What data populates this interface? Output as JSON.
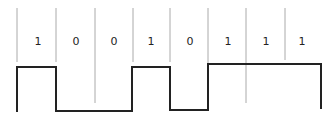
{
  "diagram": {
    "title": "",
    "bits": [
      "1",
      "0",
      "0",
      "1",
      "0",
      "1",
      "1",
      "1"
    ],
    "gridlines_x": [
      17,
      56,
      95,
      133,
      171,
      209,
      247,
      286
    ],
    "bit_centers_x": [
      36,
      76,
      114,
      152,
      190,
      228,
      266
    ],
    "signal_levels": {
      "high_y": 67,
      "low_y": 111
    },
    "colors": {
      "line": "#222222",
      "grid": "#aaaaaa"
    }
  }
}
